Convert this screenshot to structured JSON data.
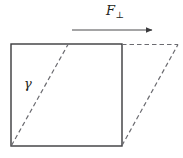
{
  "figure": {
    "type": "shear-deformation-diagram",
    "background_color": "#ffffff",
    "stroke_color": "#3a3a3c",
    "dashed_color": "#6b6b70",
    "text_color": "#231f20",
    "width": 183,
    "height": 158
  },
  "labels": {
    "force_symbol": "F",
    "force_subscript": "⊥",
    "shear_angle_symbol": "γ"
  },
  "geometry": {
    "square": {
      "x_left": 11,
      "x_right": 122,
      "y_top": 44,
      "y_bottom": 146
    },
    "shear_offset_top": 56,
    "interior_diagonal": {
      "x1": 11,
      "y1": 146,
      "x2": 68,
      "y2": 44
    },
    "sheared_right_edge": {
      "x1": 122,
      "y1": 146,
      "x2": 178,
      "y2": 44
    },
    "sheared_top_edge": {
      "x1": 122,
      "y1": 44,
      "x2": 178,
      "y2": 44
    },
    "force_arrow": {
      "x1": 72,
      "y1": 30,
      "x2": 152,
      "y2": 30
    }
  }
}
